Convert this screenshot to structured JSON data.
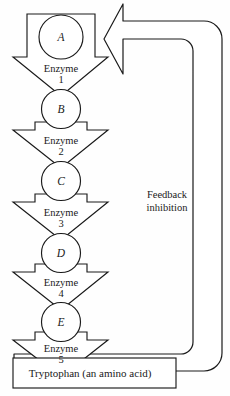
{
  "diagram": {
    "type": "biochemical-pathway",
    "colors": {
      "background": "#fefefe",
      "stroke": "#1a1a1a",
      "fill": "#ffffff"
    },
    "metabolites": [
      {
        "label": "A",
        "cx": 61,
        "cy": 37,
        "r": 22
      },
      {
        "label": "B",
        "cx": 61,
        "cy": 109,
        "r": 19.5
      },
      {
        "label": "C",
        "cx": 61,
        "cy": 181,
        "r": 19.5
      },
      {
        "label": "D",
        "cx": 61,
        "cy": 253,
        "r": 19.5
      },
      {
        "label": "E",
        "cx": 61,
        "cy": 322,
        "r": 19.5
      }
    ],
    "enzymes": [
      {
        "name": "Enzyme",
        "number": "1",
        "x": 61,
        "y": 72
      },
      {
        "name": "Enzyme",
        "number": "2",
        "x": 61,
        "y": 144
      },
      {
        "name": "Enzyme",
        "number": "3",
        "x": 61,
        "y": 216
      },
      {
        "name": "Enzyme",
        "number": "4",
        "x": 61,
        "y": 286
      },
      {
        "name": "Enzyme",
        "number": "5",
        "x": 61,
        "y": 352
      }
    ],
    "product": {
      "label": "Tryptophan (an amino acid)",
      "x": 86,
      "y": 375
    },
    "feedback": {
      "line1": "Feedback",
      "line2": "inhibition",
      "x": 167,
      "y1": 198,
      "y2": 211
    }
  }
}
